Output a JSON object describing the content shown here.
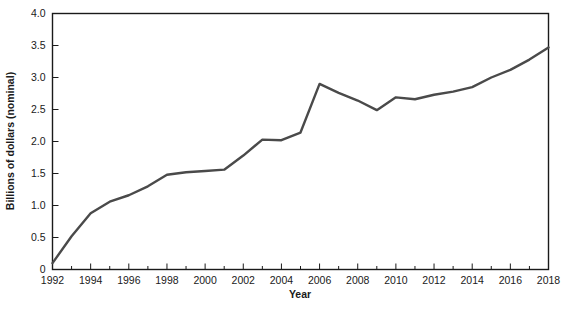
{
  "chart_data": {
    "type": "line",
    "title": "",
    "subtitle": "",
    "xlabel": "Year",
    "ylabel": "Billions of dollars (nominal)",
    "xlim": [
      1992,
      2018
    ],
    "ylim": [
      0,
      4.0
    ],
    "grid": false,
    "legend": null,
    "legend_position": "none",
    "line_color": "#4a4a4a",
    "axis_color": "#1a1a1a",
    "xticks": [
      1992,
      1994,
      1996,
      1998,
      2000,
      2002,
      2004,
      2006,
      2008,
      2010,
      2012,
      2014,
      2016,
      2018
    ],
    "xtick_labels": [
      "1992",
      "1994",
      "1996",
      "1998",
      "2000",
      "2002",
      "2004",
      "2006",
      "2008",
      "2010",
      "2012",
      "2014",
      "2016",
      "2018"
    ],
    "xtick_minor": [
      1993,
      1995,
      1997,
      1999,
      2001,
      2003,
      2005,
      2007,
      2009,
      2011,
      2013,
      2015,
      2017
    ],
    "yticks": [
      0,
      0.5,
      1.0,
      1.5,
      2.0,
      2.5,
      3.0,
      3.5,
      4.0
    ],
    "ytick_labels": [
      "0",
      "0.5",
      "1.0",
      "1.5",
      "2.0",
      "2.5",
      "3.0",
      "3.5",
      "4.0"
    ],
    "x": [
      1992,
      1993,
      1994,
      1995,
      1996,
      1997,
      1998,
      1999,
      2000,
      2001,
      2002,
      2003,
      2004,
      2005,
      2006,
      2007,
      2008,
      2009,
      2010,
      2011,
      2012,
      2013,
      2014,
      2015,
      2016,
      2017,
      2018
    ],
    "values": [
      0.1,
      0.52,
      0.88,
      1.06,
      1.16,
      1.3,
      1.48,
      1.52,
      1.54,
      1.56,
      1.78,
      2.03,
      2.02,
      2.14,
      2.9,
      2.76,
      2.64,
      2.49,
      2.69,
      2.66,
      2.73,
      2.78,
      2.85,
      3.0,
      3.12,
      3.28,
      3.47
    ],
    "series": [
      {
        "name": "Billions of dollars (nominal)",
        "values": [
          0.1,
          0.52,
          0.88,
          1.06,
          1.16,
          1.3,
          1.48,
          1.52,
          1.54,
          1.56,
          1.78,
          2.03,
          2.02,
          2.14,
          2.9,
          2.76,
          2.64,
          2.49,
          2.69,
          2.66,
          2.73,
          2.78,
          2.85,
          3.0,
          3.12,
          3.28,
          3.47
        ]
      }
    ]
  }
}
